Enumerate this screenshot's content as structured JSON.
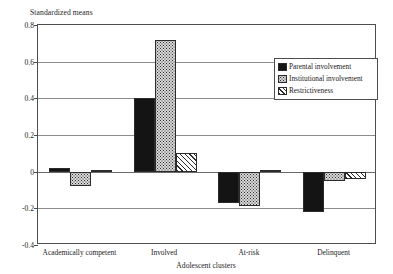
{
  "chart_data": {
    "type": "bar",
    "title": "",
    "ylabel": "Standardized means",
    "xlabel": "Adolescent clusters",
    "categories": [
      "Academically competent",
      "Involved",
      "At-risk",
      "Delinquent"
    ],
    "series": [
      {
        "name": "Parental involvement",
        "pattern": "solid",
        "values": [
          0.02,
          0.4,
          -0.17,
          -0.22
        ]
      },
      {
        "name": "Institutional involvement",
        "pattern": "dots",
        "values": [
          -0.08,
          0.72,
          -0.19,
          -0.05
        ]
      },
      {
        "name": "Restrictiveness",
        "pattern": "hatch",
        "values": [
          0.0,
          0.1,
          0.0,
          -0.04
        ]
      }
    ],
    "ylim": [
      -0.4,
      0.8
    ],
    "yticks": [
      "0.8",
      "0.6",
      "0.4",
      "0.2",
      "0",
      "-0.2",
      "-0.4"
    ],
    "ytick_values": [
      0.8,
      0.6,
      0.4,
      0.2,
      0,
      -0.2,
      -0.4
    ],
    "grid": true,
    "legend_position": "upper-right-inside"
  },
  "colors": {
    "axis": "#4d4d4d",
    "grid": "#8c8c8c",
    "bar_solid": "#141414",
    "bar_dots": "#d8d8d8",
    "bar_hatch": "#ffffff",
    "background": "#ffffff",
    "text": "#1a1a1a"
  }
}
